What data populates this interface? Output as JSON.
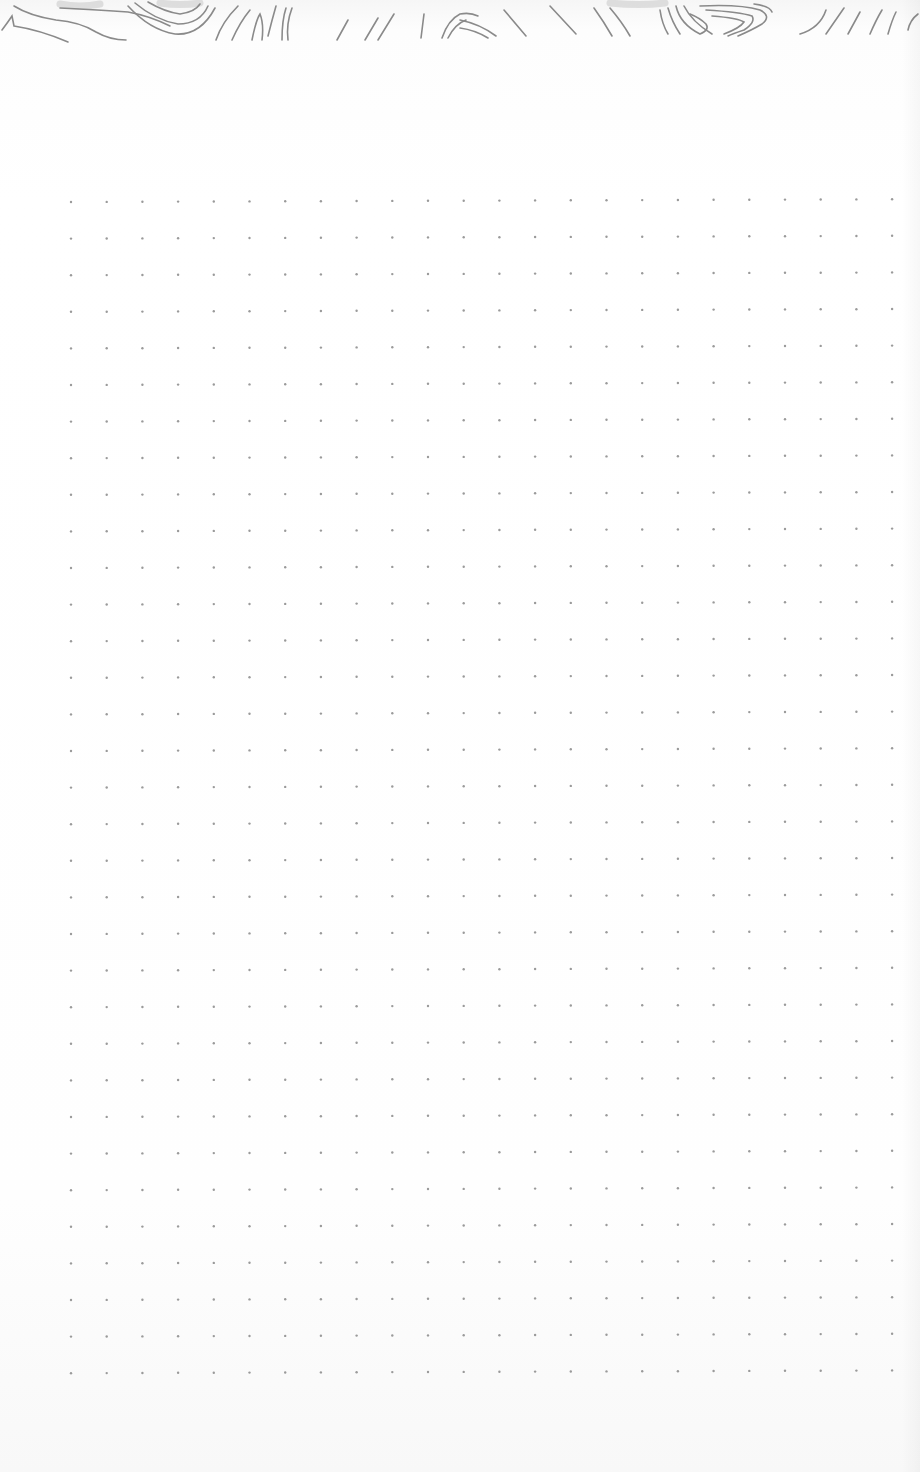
{
  "scene": {
    "description": "Photo of a dot-grid notebook page with hand-drawn topographic contour lines along the top edge",
    "paper_color": "#fdfdfd",
    "dot_color": "#9a9a9a",
    "line_color": "#8a8a8a"
  },
  "dot_grid": {
    "origin_x": 71,
    "origin_y": 202,
    "spacing_x": 35.7,
    "spacing_y": 36.6,
    "columns": 24,
    "rows": 33,
    "dot_radius": 1.2
  },
  "contour_art": {
    "position": "top-edge",
    "style": "topographic contour lines"
  }
}
